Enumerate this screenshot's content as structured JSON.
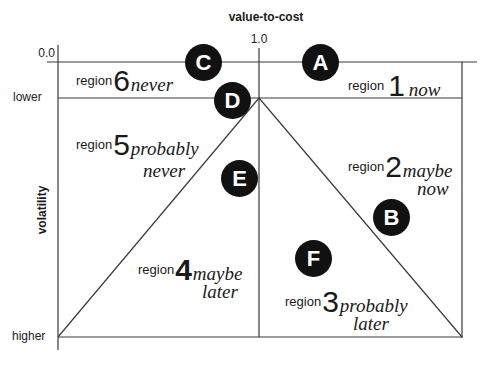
{
  "axes": {
    "x_title": "value-to-cost",
    "y_title": "volatility",
    "x_tick_left": "0.0",
    "x_tick_mid": "1.0",
    "y_tick_lower": "lower",
    "y_tick_higher": "higher"
  },
  "regions": {
    "r1": {
      "prefix": "region",
      "number": "1",
      "line1": "now",
      "line2": ""
    },
    "r2": {
      "prefix": "region",
      "number": "2",
      "line1": "maybe",
      "line2": "now"
    },
    "r3": {
      "prefix": "region",
      "number": "3",
      "line1": "probably",
      "line2": "later"
    },
    "r4": {
      "prefix": "region",
      "number": "4",
      "line1": "maybe",
      "line2": "later"
    },
    "r5": {
      "prefix": "region",
      "number": "5",
      "line1": "probably",
      "line2": "never"
    },
    "r6": {
      "prefix": "region",
      "number": "6",
      "line1": "never",
      "line2": ""
    }
  },
  "markers": {
    "a": "A",
    "b": "B",
    "c": "C",
    "d": "D",
    "e": "E",
    "f": "F"
  },
  "colors": {
    "line": "#3a3a3a",
    "marker_fill": "#111111",
    "marker_text": "#ffffff",
    "background": "#ffffff"
  }
}
